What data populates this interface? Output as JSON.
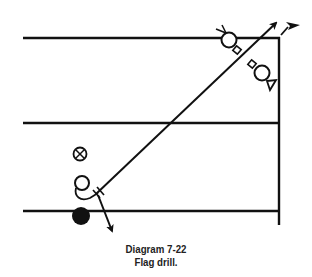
{
  "diagram": {
    "title": "Diagram 7-22",
    "subtitle": "Flag drill.",
    "ink_color": "#111111",
    "background_color": "#ffffff",
    "elements": [
      {
        "name": "yard-line-top",
        "kind": "field-line"
      },
      {
        "name": "yard-line-middle",
        "kind": "field-line"
      },
      {
        "name": "yard-line-bottom",
        "kind": "field-line"
      },
      {
        "name": "sideline",
        "kind": "field-line"
      },
      {
        "name": "pass-route",
        "kind": "arrow-path",
        "description": "diagonal route toward the flag (corner)"
      },
      {
        "name": "ball",
        "kind": "filled-circle",
        "description": "snap/ball position"
      },
      {
        "name": "receiver",
        "kind": "open-circle"
      },
      {
        "name": "quarterback",
        "kind": "crossed-circle"
      },
      {
        "name": "defender-deep",
        "kind": "defender-symbol"
      },
      {
        "name": "defender-corner",
        "kind": "defender-symbol"
      },
      {
        "name": "flag-marker",
        "kind": "pennant-arrow"
      }
    ]
  }
}
